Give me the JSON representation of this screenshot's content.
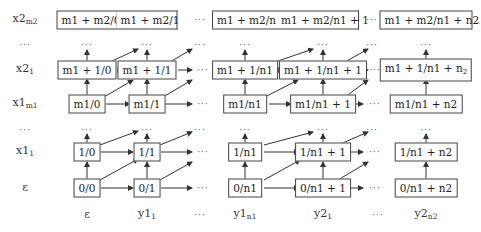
{
  "row_labels": [
    {
      "id": "x2m2",
      "base": "x2",
      "sub": "m2"
    },
    {
      "id": "dots",
      "base": "···",
      "sub": ""
    },
    {
      "id": "x21",
      "base": "x2",
      "sub": "1"
    },
    {
      "id": "x1m1",
      "base": "x1",
      "sub": "m1"
    },
    {
      "id": "dots2",
      "base": "···",
      "sub": ""
    },
    {
      "id": "x11",
      "base": "x1",
      "sub": "1"
    },
    {
      "id": "eps",
      "base": "ε",
      "sub": ""
    }
  ],
  "col_labels": [
    {
      "base": "ε",
      "sub": ""
    },
    {
      "base": "y1",
      "sub": "1"
    },
    {
      "base": "···",
      "sub": ""
    },
    {
      "base": "y1",
      "sub": "n1"
    },
    {
      "base": "y2",
      "sub": "1"
    },
    {
      "base": "···",
      "sub": ""
    },
    {
      "base": "y2",
      "sub": "n2"
    }
  ],
  "top_row": [
    "m1 + m2/0",
    "m1 + m2/1",
    "m1 + m2/n1",
    "m1 + m2/n1 + 1",
    "m1 + m2/n1 + n2"
  ],
  "row_x21": [
    "m1 + 1/0",
    "m1 + 1/1",
    "m1 + 1/n1",
    "m1 + 1/n1 + 1",
    "m1 + 1/n1 + n"
  ],
  "row_x21_last_sub": "2",
  "row_x1m1": [
    "m1/0",
    "m1/1",
    "m1/n1",
    "m1/n1 + 1",
    "m1/n1 + n2"
  ],
  "row_x11": [
    "1/0",
    "1/1",
    "1/n1",
    "1/n1 + 1",
    "1/n1 + n2"
  ],
  "row_eps": [
    "0/0",
    "0/1",
    "0/n1",
    "0/n1 + 1",
    "0/n1 + n2"
  ],
  "ellipsis": "···"
}
